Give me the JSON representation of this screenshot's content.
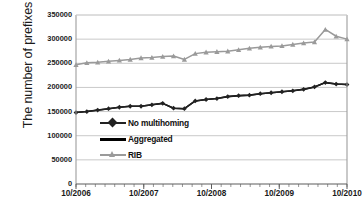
{
  "chart_data": {
    "type": "line",
    "title": "",
    "xlabel": "",
    "ylabel": "The number of prefixes",
    "ylim": [
      0,
      350000
    ],
    "y_ticks": [
      0,
      50000,
      100000,
      150000,
      200000,
      250000,
      300000,
      350000
    ],
    "y_tick_labels": [
      "0",
      "50000",
      "100000",
      "150000",
      "200000",
      "250000",
      "300000",
      "350000"
    ],
    "x_tick_labels": [
      "10/2006",
      "10/2007",
      "10/2008",
      "10/2009",
      "10/2010"
    ],
    "x_major_positions": [
      0,
      7,
      14,
      21,
      28
    ],
    "x_minor_count": 29,
    "grid": "horizontal",
    "legend_position": "inside-left-middle",
    "x": [
      "10/2006",
      "12/2006",
      "02/2007",
      "04/2007",
      "06/2007",
      "08/2007",
      "10/2007",
      "12/2007",
      "02/2008",
      "04/2008",
      "06/2008",
      "08/2008",
      "10/2008",
      "12/2008",
      "02/2009",
      "04/2009",
      "06/2009",
      "08/2009",
      "10/2009",
      "12/2009",
      "02/2010",
      "04/2010",
      "06/2010",
      "08/2010",
      "09/2010",
      "10/2010"
    ],
    "series": [
      {
        "name": "No multihoming",
        "color": "#222222",
        "marker": "diamond",
        "values": [
          148000,
          150000,
          153000,
          156000,
          159000,
          161000,
          161000,
          164000,
          167000,
          157000,
          156000,
          172000,
          175000,
          177000,
          181000,
          183000,
          184000,
          187000,
          189000,
          191000,
          193000,
          196000,
          201000,
          210000,
          207000,
          206000
        ]
      },
      {
        "name": "Aggregated",
        "color": "#000000",
        "marker": "none",
        "values": [
          148000,
          150000,
          153000,
          156000,
          159000,
          161000,
          161000,
          164000,
          167000,
          157000,
          156000,
          172000,
          175000,
          177000,
          181000,
          183000,
          184000,
          187000,
          189000,
          191000,
          193000,
          196000,
          201000,
          210000,
          207000,
          206000
        ]
      },
      {
        "name": "RIB",
        "color": "#9a9a9a",
        "marker": "triangle",
        "values": [
          247000,
          251000,
          252000,
          254000,
          256000,
          258000,
          261000,
          262000,
          264000,
          265000,
          258000,
          270000,
          273000,
          274000,
          275000,
          278000,
          281000,
          283000,
          285000,
          286000,
          289000,
          292000,
          294000,
          320000,
          306000,
          300000
        ]
      }
    ]
  },
  "legend": {
    "items": [
      {
        "label": "No multihoming"
      },
      {
        "label": "Aggregated"
      },
      {
        "label": "RIB"
      }
    ]
  }
}
